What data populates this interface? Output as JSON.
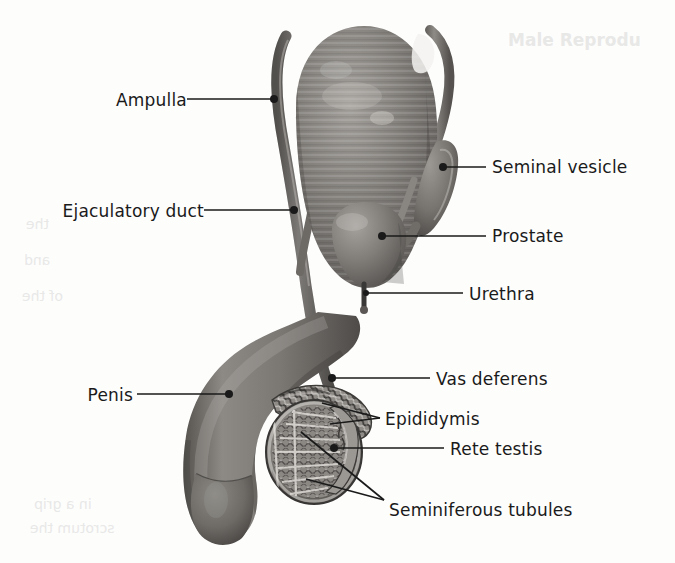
{
  "figure": {
    "background_color": "#fdfdfc",
    "ink_color": "#1a1a1a",
    "tissue_color": "#7e7b78",
    "tissue_shadow_color": "#4f4c4a",
    "tissue_highlight_color": "#a9a6a2"
  },
  "ghost_text": {
    "top_right": "Male Reprodu",
    "mid_left_1": "the",
    "mid_left_2": "and",
    "mid_left_3": "of the",
    "bottom_left_1": "in a grip",
    "bottom_left_2": "scrotum the"
  },
  "labels": {
    "ampulla": {
      "text": "Ampulla",
      "side": "left",
      "text_x": 86,
      "text_y": 92,
      "leader": {
        "x1": 187,
        "y1": 99,
        "x2": 273,
        "y2": 99
      },
      "dot": {
        "cx": 274,
        "cy": 99,
        "r": 4
      }
    },
    "ejaculatory_duct": {
      "text": "Ejaculatory duct",
      "side": "left",
      "text_x": 30,
      "text_y": 203,
      "leader": {
        "x1": 204,
        "y1": 210,
        "x2": 293,
        "y2": 210
      },
      "dot": {
        "cx": 294,
        "cy": 210,
        "r": 4
      }
    },
    "penis": {
      "text": "Penis",
      "side": "left",
      "text_x": 73,
      "text_y": 387,
      "leader": {
        "x1": 137,
        "y1": 394,
        "x2": 228,
        "y2": 394
      },
      "dot": {
        "cx": 229,
        "cy": 394,
        "r": 4
      }
    },
    "seminal_vesicle": {
      "text": "Seminal vesicle",
      "side": "right",
      "text_x": 492,
      "text_y": 159,
      "leader": {
        "x1": 444,
        "y1": 167,
        "x2": 486,
        "y2": 167
      },
      "dot": {
        "cx": 443,
        "cy": 167,
        "r": 4
      }
    },
    "prostate": {
      "text": "Prostate",
      "side": "right",
      "text_x": 492,
      "text_y": 228,
      "leader": {
        "x1": 383,
        "y1": 236,
        "x2": 486,
        "y2": 236
      },
      "dot": {
        "cx": 382,
        "cy": 236,
        "r": 4
      }
    },
    "urethra": {
      "text": "Urethra",
      "side": "right",
      "text_x": 469,
      "text_y": 286,
      "leader": {
        "x1": 366,
        "y1": 293,
        "x2": 463,
        "y2": 293
      },
      "dot": {
        "cx": 366,
        "cy": 293,
        "r": 3
      }
    },
    "vas_deferens": {
      "text": "Vas deferens",
      "side": "right",
      "text_x": 436,
      "text_y": 371,
      "leader": {
        "x1": 333,
        "y1": 378,
        "x2": 430,
        "y2": 378
      },
      "dot": {
        "cx": 332,
        "cy": 378,
        "r": 4
      }
    },
    "epididymis": {
      "text": "Epididymis",
      "side": "right",
      "text_x": 385,
      "text_y": 411,
      "leader": {
        "x1": 322,
        "y1": 403,
        "x2": 380,
        "y2": 418
      },
      "leader2": {
        "x1": 330,
        "y1": 424,
        "x2": 380,
        "y2": 418
      }
    },
    "rete_testis": {
      "text": "Rete testis",
      "side": "right",
      "text_x": 450,
      "text_y": 441,
      "leader": {
        "x1": 334,
        "y1": 448,
        "x2": 444,
        "y2": 448
      },
      "dot": {
        "cx": 334,
        "cy": 448,
        "r": 4
      }
    },
    "seminiferous_tubules": {
      "text": "Seminiferous tubules",
      "side": "right",
      "text_x": 389,
      "text_y": 502,
      "leader": {
        "x1": 301,
        "y1": 432,
        "x2": 384,
        "y2": 500
      },
      "leader2": {
        "x1": 306,
        "y1": 479,
        "x2": 384,
        "y2": 500
      }
    }
  },
  "anatomy_parts": [
    "bladder",
    "vas-deferens-left",
    "vas-deferens-right",
    "seminal-vesicle",
    "prostate",
    "urethra",
    "penis-shaft",
    "glans",
    "testis-cross-section",
    "epididymis-structure",
    "rete-testis-region",
    "seminiferous-tubule-lobules"
  ]
}
